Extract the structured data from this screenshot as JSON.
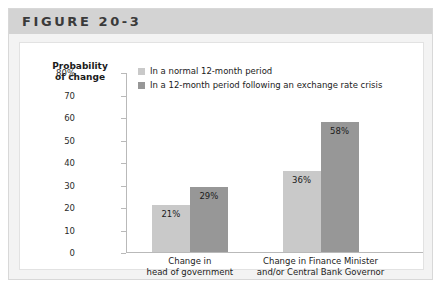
{
  "figure": {
    "title": "FIGURE 20-3"
  },
  "chart_data": {
    "type": "bar",
    "title": "",
    "xlabel": "",
    "ylabel": "Probability of change",
    "ylabel_lines": [
      "Probability",
      "of change"
    ],
    "ylim": [
      0,
      80
    ],
    "yticks": [
      80,
      70,
      60,
      50,
      40,
      30,
      20,
      10,
      0
    ],
    "ytick_labels": [
      "80%",
      "70",
      "60",
      "50",
      "40",
      "30",
      "20",
      "10",
      "0"
    ],
    "grid": false,
    "legend_position": "top-left-inside",
    "categories": [
      "Change in head of government",
      "Change in Finance Minister and/or Central Bank Governor"
    ],
    "category_label_lines": [
      [
        "Change in",
        "head of government"
      ],
      [
        "Change in Finance Minister",
        "and/or Central Bank Governor"
      ]
    ],
    "series": [
      {
        "name": "In a normal 12-month period",
        "color": "#c9c9c9",
        "values": [
          21,
          36
        ],
        "value_labels": [
          "21%",
          "36%"
        ]
      },
      {
        "name": "In a 12-month period following an exchange rate crisis",
        "color": "#979797",
        "values": [
          29,
          58
        ],
        "value_labels": [
          "29%",
          "58%"
        ]
      }
    ]
  },
  "colors": {
    "header_band": "#d3d3d3",
    "frame_background": "#f3f3f3",
    "card_background": "#ffffff",
    "axis": "#b9b9b9",
    "series_light": "#c9c9c9",
    "series_dark": "#979797",
    "text": "#1b1b1b"
  }
}
